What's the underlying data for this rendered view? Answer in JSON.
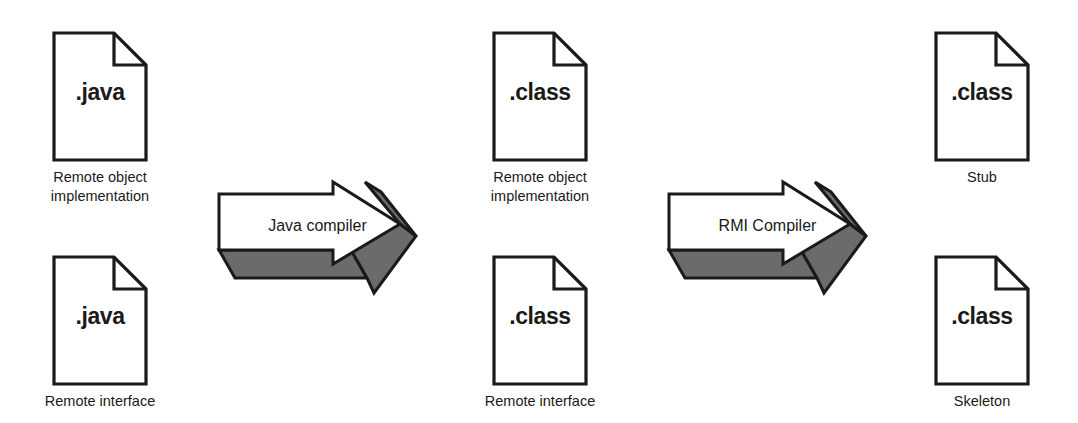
{
  "diagram": {
    "colors": {
      "stroke": "#1a1a1a",
      "face": "#ffffff",
      "shade": "#6b6b6b",
      "text": "#1a1a1a",
      "background": "#ffffff"
    }
  },
  "columns": [
    {
      "name": "source-files",
      "documents": [
        {
          "ext": ".java",
          "caption": "Remote object\nimplementation"
        },
        {
          "ext": ".java",
          "caption": "Remote interface"
        }
      ]
    },
    {
      "name": "compiled-classes",
      "documents": [
        {
          "ext": ".class",
          "caption": "Remote object\nimplementation"
        },
        {
          "ext": ".class",
          "caption": "Remote interface"
        }
      ]
    },
    {
      "name": "rmi-artifacts",
      "documents": [
        {
          "ext": ".class",
          "caption": "Stub"
        },
        {
          "ext": ".class",
          "caption": "Skeleton"
        }
      ]
    }
  ],
  "arrows": [
    {
      "name": "java-compiler-arrow",
      "label": "Java compiler"
    },
    {
      "name": "rmi-compiler-arrow",
      "label": "RMI Compiler"
    }
  ]
}
